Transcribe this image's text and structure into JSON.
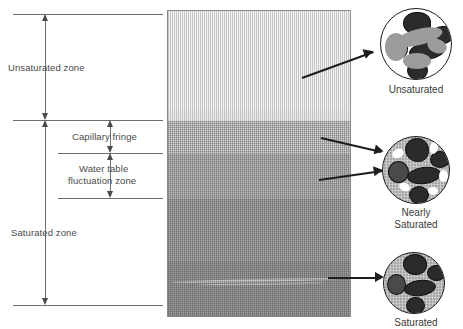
{
  "figure": {
    "zones": [
      {
        "id": "unsaturated",
        "label": "Unsaturated zone"
      },
      {
        "id": "capillary-fringe",
        "label": "Capillary fringe"
      },
      {
        "id": "water-table",
        "label_line1": "Water table",
        "label_line2": "fluctuation zone"
      },
      {
        "id": "saturated",
        "label": "Saturated zone"
      }
    ],
    "insets": [
      {
        "id": "unsaturated",
        "label_line1": "Unsaturated",
        "label_line2": ""
      },
      {
        "id": "nearly-saturated",
        "label_line1": "Nearly",
        "label_line2": "Saturated"
      },
      {
        "id": "saturated",
        "label_line1": "Saturated",
        "label_line2": ""
      }
    ],
    "colors": {
      "grain": "#2b2b2b",
      "water": "#9a9a9a",
      "air": "#ffffff",
      "outline": "#1a1a1a",
      "rule": "#6e6e6e",
      "text": "#4a4a4a"
    },
    "column_bands": [
      {
        "id": "band-unsaturated-top",
        "shade": "#f2f2f2"
      },
      {
        "id": "band-unsaturated-low",
        "shade": "#eaeaea"
      },
      {
        "id": "band-capillary",
        "shade": "#d6d6d6"
      },
      {
        "id": "band-fluctuation",
        "shade": "#bdbdbd"
      },
      {
        "id": "band-saturated-upper",
        "shade": "#a8a8a8"
      },
      {
        "id": "band-saturated-lower",
        "shade": "#9a9a9a"
      }
    ]
  }
}
